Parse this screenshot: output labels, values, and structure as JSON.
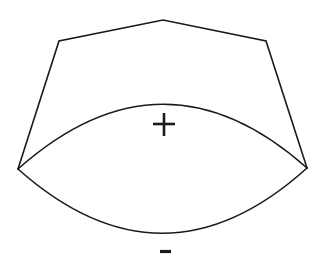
{
  "diagram": {
    "colors": {
      "stroke": "#1a1a1a",
      "background": "#ffffff"
    },
    "polygon_outline": {
      "points": [
        [
          18,
          169
        ],
        [
          59,
          41
        ],
        [
          163,
          20
        ],
        [
          266,
          41
        ],
        [
          307,
          168
        ]
      ]
    },
    "upper_arc": {
      "start": [
        18,
        169
      ],
      "control": [
        163,
        40
      ],
      "end": [
        307,
        168
      ],
      "label": "+"
    },
    "lower_arc": {
      "start": [
        18,
        169
      ],
      "control": [
        163,
        298
      ],
      "end": [
        307,
        168
      ],
      "label": "-"
    },
    "labels": {
      "plus": {
        "text": "+",
        "center": [
          164,
          124
        ]
      },
      "minus": {
        "text": "-",
        "center": [
          165,
          252
        ]
      }
    }
  }
}
